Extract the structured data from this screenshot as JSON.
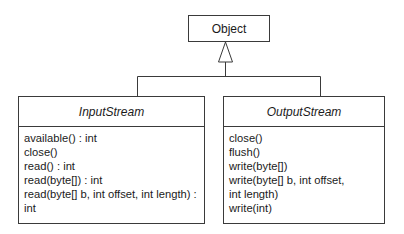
{
  "diagram": {
    "type": "uml-class-inheritance",
    "parent": {
      "name": "Object"
    },
    "children": [
      {
        "name": "InputStream",
        "abstract": true,
        "methods": [
          "available() : int",
          "close()",
          "read() : int",
          "read(byte[]) : int",
          "read(byte[] b, int offset, int length) :",
          "int"
        ]
      },
      {
        "name": "OutputStream",
        "abstract": true,
        "methods": [
          "close()",
          "flush()",
          "write(byte[])",
          "write(byte[] b, int offset,",
          "int length)",
          "write(int)"
        ]
      }
    ],
    "line_color": "#3a3a3a"
  }
}
